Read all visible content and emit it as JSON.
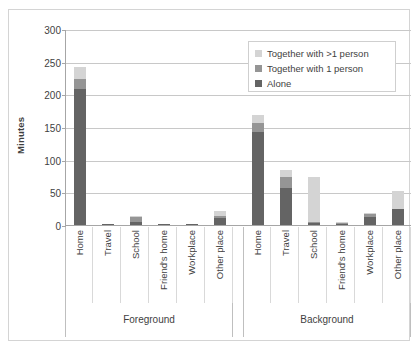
{
  "chart_data": {
    "type": "bar",
    "subtype": "stacked-bar",
    "title": "",
    "xlabel": "",
    "ylabel": "Minutes",
    "ylim": [
      0,
      300
    ],
    "yticks": [
      0,
      50,
      100,
      150,
      200,
      250,
      300
    ],
    "grid": true,
    "legend_position": "top-right",
    "categories": [
      "Home",
      "Travel",
      "School",
      "Friend's home",
      "Workplace",
      "Other place"
    ],
    "groups": [
      "Foreground",
      "Background"
    ],
    "series": [
      {
        "name": "Alone",
        "color": "#646464",
        "values_foreground": [
          208,
          0.5,
          5,
          0.5,
          0.5,
          10
        ],
        "values_background": [
          143,
          57,
          3,
          1,
          12,
          24
        ]
      },
      {
        "name": "Together with 1 person",
        "color": "#959595",
        "values_foreground": [
          16,
          0,
          7,
          0,
          0,
          4
        ],
        "values_background": [
          13,
          16,
          2,
          0.5,
          5,
          0
        ]
      },
      {
        "name": "Together with >1 person",
        "color": "#d4d4d4",
        "values_foreground": [
          18,
          0,
          2,
          0,
          0,
          7
        ],
        "values_background": [
          13,
          11,
          69,
          0.5,
          1,
          28
        ]
      }
    ],
    "totals_foreground": [
      242,
      0.5,
      14,
      0.5,
      0.5,
      21
    ],
    "totals_background": [
      169,
      84,
      74,
      2,
      18,
      52
    ]
  },
  "legend": {
    "items": [
      {
        "label": "Together with >1 person",
        "color": "#d4d4d4"
      },
      {
        "label": "Together with 1 person",
        "color": "#959595"
      },
      {
        "label": "Alone",
        "color": "#646464"
      }
    ]
  },
  "axes": {
    "y_title": "Minutes",
    "y_tick_labels": [
      "300",
      "250",
      "200",
      "150",
      "100",
      "50",
      "0"
    ]
  }
}
